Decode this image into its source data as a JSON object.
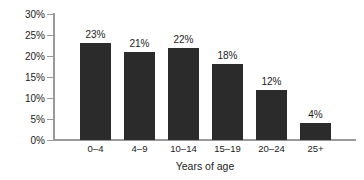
{
  "chart_data": {
    "type": "bar",
    "title": "",
    "subtitle": "",
    "xlabel": "Years of age",
    "ylabel": "",
    "categories": [
      "0–4",
      "4–9",
      "10–14",
      "15–19",
      "20–24",
      "25+"
    ],
    "values": [
      23,
      21,
      22,
      18,
      12,
      4
    ],
    "value_labels": [
      "23%",
      "21%",
      "22%",
      "18%",
      "12%",
      "4%"
    ],
    "ylim": [
      0,
      30
    ],
    "ytick_values": [
      0,
      5,
      10,
      15,
      20,
      25,
      30
    ],
    "ytick_labels": [
      "0%",
      "5%",
      "10%",
      "15%",
      "20%",
      "25%",
      "30%"
    ],
    "grid": false,
    "legend": null,
    "legend_position": "none",
    "bar_color": "#2b2b2b",
    "axis_color": "#9a9a9a",
    "text_color": "#1c1c1c",
    "background_color": "#ffffff"
  }
}
